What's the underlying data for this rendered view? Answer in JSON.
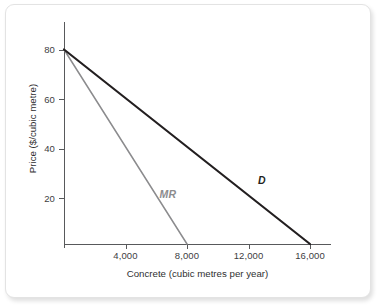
{
  "chart_data": {
    "type": "line",
    "title": "",
    "xlabel": "Concrete (cubic metres per year)",
    "ylabel": "Price ($/cubic metre)",
    "xlim": [
      0,
      17500
    ],
    "ylim": [
      0,
      90
    ],
    "xticks": [
      4000,
      8000,
      12000,
      16000
    ],
    "xtick_labels": [
      "4,000",
      "8,000",
      "12,000",
      "16,000"
    ],
    "yticks": [
      20,
      40,
      60,
      80
    ],
    "ytick_labels": [
      "20",
      "40",
      "60",
      "80"
    ],
    "grid": false,
    "legend_position": "inline-annotations",
    "series": [
      {
        "name": "D",
        "label": "D",
        "label_color": "#231f20",
        "color": "#231f20",
        "width": 2.2,
        "x": [
          0,
          16000
        ],
        "y": [
          80,
          0
        ]
      },
      {
        "name": "MR",
        "label": "MR",
        "label_color": "#8c8c8e",
        "color": "#8c8c8e",
        "width": 1.5,
        "x": [
          0,
          8000
        ],
        "y": [
          80,
          0
        ]
      }
    ],
    "annotations": [
      {
        "text": "D",
        "x": 13000,
        "y": 26
      },
      {
        "text": "MR",
        "x": 6600,
        "y": 20
      }
    ]
  },
  "axes": {
    "y_title": "Price ($/cubic metre)",
    "x_title": "Concrete (cubic metres per year)",
    "y_ticks": [
      {
        "value": 80,
        "label": "80"
      },
      {
        "value": 60,
        "label": "60"
      },
      {
        "value": 40,
        "label": "40"
      },
      {
        "value": 20,
        "label": "20"
      }
    ],
    "x_ticks": [
      {
        "value": 4000,
        "label": "4,000"
      },
      {
        "value": 8000,
        "label": "8,000"
      },
      {
        "value": 12000,
        "label": "12,000"
      },
      {
        "value": 16000,
        "label": "16,000"
      }
    ]
  },
  "curves": {
    "demand_label": "D",
    "marginal_revenue_label": "MR"
  },
  "colors": {
    "demand_line": "#231f20",
    "marginal_revenue_line": "#8c8c8e",
    "axis": "#58595b",
    "text": "#2f2f31",
    "card_background": "#ffffff",
    "card_border": "#e3e3e3"
  }
}
